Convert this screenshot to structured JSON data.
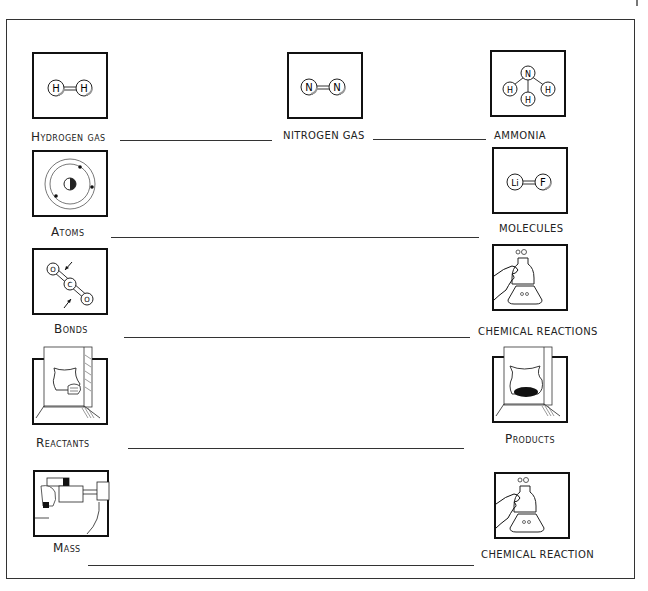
{
  "worksheet": {
    "rows": [
      {
        "left": {
          "label": "Hydrogen gas",
          "icon": "hydrogen-molecule-icon"
        },
        "middle": {
          "label": "NITROGEN GAS",
          "icon": "nitrogen-molecule-icon"
        },
        "right": {
          "label": "AMMONIA",
          "icon": "ammonia-molecule-icon"
        }
      },
      {
        "left": {
          "label": "Atoms",
          "icon": "atom-icon"
        },
        "right": {
          "label": "MOLECULES",
          "icon": "lif-molecule-icon"
        }
      },
      {
        "left": {
          "label": "Bonds",
          "icon": "co2-bonds-icon"
        },
        "right": {
          "label": "CHEMICAL REACTIONS",
          "icon": "flask-reaction-icon"
        }
      },
      {
        "left": {
          "label": "Reactants",
          "icon": "fireplace-wood-icon"
        },
        "right": {
          "label": "Products",
          "icon": "fireplace-ash-icon"
        }
      },
      {
        "left": {
          "label": "Mass",
          "icon": "balance-scale-icon"
        },
        "right": {
          "label": "CHEMICAL REACTION",
          "icon": "flask-reaction-icon"
        }
      }
    ],
    "atoms": {
      "hydrogen": [
        "H",
        "H"
      ],
      "nitrogen": [
        "N",
        "N"
      ],
      "ammonia": [
        "N",
        "H",
        "H",
        "H"
      ],
      "molecule": [
        "Li",
        "F"
      ],
      "co2": [
        "O",
        "C",
        "O"
      ]
    }
  }
}
